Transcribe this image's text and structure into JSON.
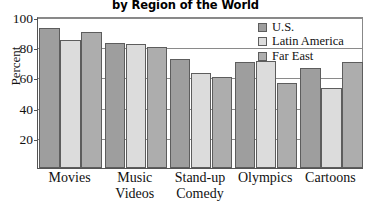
{
  "chart_data": {
    "type": "bar",
    "title": "by Region of the World",
    "xlabel": "",
    "ylabel": "Percent",
    "ylim": [
      0,
      100
    ],
    "yticks": [
      20,
      40,
      60,
      80,
      100
    ],
    "grid": true,
    "legend_position": "top-right",
    "categories": [
      "Movies",
      "Music Videos",
      "Stand-up Comedy",
      "Olympics",
      "Cartoons"
    ],
    "category_lines": [
      [
        "Movies"
      ],
      [
        "Music",
        "Videos"
      ],
      [
        "Stand-up",
        "Comedy"
      ],
      [
        "Olympics"
      ],
      [
        "Cartoons"
      ]
    ],
    "series": [
      {
        "name": "U.S.",
        "color": "#9e9e9e",
        "values": [
          93,
          83,
          72,
          70,
          66
        ]
      },
      {
        "name": "Latin America",
        "color": "#dcdcdc",
        "values": [
          85,
          82,
          63,
          71,
          53
        ]
      },
      {
        "name": "Far East",
        "color": "#adadad",
        "values": [
          90,
          80,
          60,
          56,
          70
        ]
      }
    ]
  },
  "axis": {
    "y_tick_labels": [
      "100",
      "80",
      "60",
      "40",
      "20"
    ]
  },
  "legend": {
    "items": [
      {
        "label": "U.S.",
        "swatch": "#9e9e9e"
      },
      {
        "label": "Latin America",
        "swatch": "#dcdcdc"
      },
      {
        "label": "Far East",
        "swatch": "#adadad"
      }
    ]
  }
}
